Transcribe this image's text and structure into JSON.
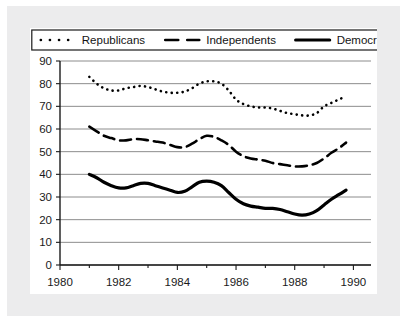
{
  "chart_data": {
    "type": "line",
    "title": "",
    "subtitle": "",
    "xlabel": "",
    "ylabel": "",
    "xlim": [
      1980,
      1990.6
    ],
    "ylim": [
      0,
      90
    ],
    "grid": true,
    "grid_axis": "y",
    "legend_position": "top-center",
    "x_tick_labels": [
      "1980",
      "1982",
      "1984",
      "1986",
      "1988",
      "1990"
    ],
    "x_ticks": [
      1980,
      1982,
      1984,
      1986,
      1988,
      1990
    ],
    "x_minor_ticks": [
      1981,
      1983,
      1985,
      1987,
      1989
    ],
    "y_tick_labels": [
      "0",
      "10",
      "20",
      "30",
      "40",
      "50",
      "60",
      "70",
      "80",
      "90"
    ],
    "y_ticks": [
      0,
      10,
      20,
      30,
      40,
      50,
      60,
      70,
      80,
      90
    ],
    "series": [
      {
        "name": "Republicans",
        "line_style": "dotted",
        "color": "#000000",
        "x": [
          1981.0,
          1981.25,
          1981.5,
          1981.75,
          1982.0,
          1982.25,
          1982.5,
          1982.75,
          1983.0,
          1983.25,
          1983.5,
          1983.75,
          1984.0,
          1984.25,
          1984.5,
          1984.75,
          1985.0,
          1985.25,
          1985.5,
          1985.75,
          1986.0,
          1986.25,
          1986.5,
          1986.75,
          1987.0,
          1987.25,
          1987.5,
          1987.75,
          1988.0,
          1988.25,
          1988.5,
          1988.75,
          1989.0,
          1989.25,
          1989.5,
          1989.75
        ],
        "values": [
          83,
          80,
          78,
          77,
          77,
          78,
          78.5,
          79,
          78.5,
          77.5,
          76.5,
          76,
          76,
          76.5,
          78,
          80,
          81,
          81,
          80,
          77,
          73,
          71,
          70,
          69.5,
          69.5,
          69,
          68,
          67,
          66.5,
          66,
          66,
          67,
          70,
          71.5,
          73,
          74.5
        ]
      },
      {
        "name": "Independents",
        "line_style": "dashed",
        "color": "#000000",
        "x": [
          1981.0,
          1981.25,
          1981.5,
          1981.75,
          1982.0,
          1982.25,
          1982.5,
          1982.75,
          1983.0,
          1983.25,
          1983.5,
          1983.75,
          1984.0,
          1984.25,
          1984.5,
          1984.75,
          1985.0,
          1985.25,
          1985.5,
          1985.75,
          1986.0,
          1986.25,
          1986.5,
          1986.75,
          1987.0,
          1987.25,
          1987.5,
          1987.75,
          1988.0,
          1988.25,
          1988.5,
          1988.75,
          1989.0,
          1989.25,
          1989.5,
          1989.75
        ],
        "values": [
          61,
          59,
          57,
          56,
          55,
          55,
          55.5,
          55.5,
          55,
          54.5,
          54,
          53,
          52,
          52,
          53.5,
          55.5,
          57,
          56.5,
          55,
          53,
          50,
          48,
          47,
          46.5,
          46,
          45,
          44.5,
          44,
          43.5,
          43.5,
          44,
          45,
          47,
          49.5,
          51.5,
          54
        ]
      },
      {
        "name": "Democrats",
        "line_style": "solid",
        "color": "#000000",
        "x": [
          1981.0,
          1981.25,
          1981.5,
          1981.75,
          1982.0,
          1982.25,
          1982.5,
          1982.75,
          1983.0,
          1983.25,
          1983.5,
          1983.75,
          1984.0,
          1984.25,
          1984.5,
          1984.75,
          1985.0,
          1985.25,
          1985.5,
          1985.75,
          1986.0,
          1986.25,
          1986.5,
          1986.75,
          1987.0,
          1987.25,
          1987.5,
          1987.75,
          1988.0,
          1988.25,
          1988.5,
          1988.75,
          1989.0,
          1989.25,
          1989.5,
          1989.75
        ],
        "values": [
          40,
          38.5,
          36.5,
          35,
          34,
          34,
          35,
          36,
          36,
          35,
          34,
          33,
          32,
          32.5,
          34.5,
          36.5,
          37,
          36.5,
          35,
          32,
          29,
          27,
          26,
          25.5,
          25,
          25,
          24.5,
          23.5,
          22.5,
          22,
          22.5,
          24,
          26.5,
          29,
          31,
          33
        ]
      }
    ]
  },
  "legend": {
    "items": [
      {
        "label": "Republicans",
        "style": "dotted"
      },
      {
        "label": "Independents",
        "style": "dashed"
      },
      {
        "label": "Democrats",
        "style": "solid"
      }
    ]
  },
  "colors": {
    "series_ink": "#000000",
    "gridline": "#8c8c8c",
    "axis": "#1a1a1a",
    "panel_background": "#ffffff",
    "mat_background": "#ececed"
  }
}
